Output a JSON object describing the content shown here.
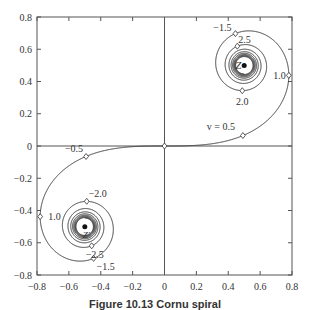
{
  "chart_data": {
    "type": "line",
    "title": "Cornu spiral",
    "xlabel": "",
    "ylabel": "",
    "xlim": [
      -0.8,
      0.8
    ],
    "ylim": [
      -0.8,
      0.8
    ],
    "grid": false,
    "x_ticks": [
      "-0.8",
      "-0.6",
      "-0.4",
      "-0.2",
      "0",
      "0.2",
      "0.4",
      "0.6",
      "0.8"
    ],
    "y_ticks": [
      "0.8",
      "0.6",
      "0.4",
      "0.2",
      "0",
      "-0.2",
      "-0.4",
      "-0.6",
      "-0.8"
    ],
    "series": [
      {
        "name": "Cornu spiral C(v), S(v)",
        "v_range": [
          -6,
          6
        ],
        "description": "x = C(v) = integral cos(pi t^2/2), y = S(v) = integral sin(pi t^2/2)"
      }
    ],
    "markers": [
      {
        "v": 0.0,
        "x": 0.0,
        "y": 0.0,
        "label": ""
      },
      {
        "v": 0.5,
        "x": 0.492,
        "y": 0.065,
        "label": "v = 0.5"
      },
      {
        "v": 1.0,
        "x": 0.78,
        "y": 0.438,
        "label": "1.0"
      },
      {
        "v": 1.5,
        "x": 0.445,
        "y": 0.697,
        "label": "-1.5"
      },
      {
        "v": 2.0,
        "x": 0.488,
        "y": 0.343,
        "label": "2.0"
      },
      {
        "v": 2.5,
        "x": 0.457,
        "y": 0.619,
        "label": "2.5"
      },
      {
        "v": -0.5,
        "x": -0.492,
        "y": -0.065,
        "label": "-0.5"
      },
      {
        "v": -1.0,
        "x": -0.78,
        "y": -0.438,
        "label": "1.0"
      },
      {
        "v": -1.5,
        "x": -0.445,
        "y": -0.697,
        "label": "-1.5"
      },
      {
        "v": -2.0,
        "x": -0.488,
        "y": -0.343,
        "label": "-2.0"
      },
      {
        "v": -2.5,
        "x": -0.457,
        "y": -0.619,
        "label": "-2.5"
      }
    ],
    "annotations": [
      {
        "text": "Z",
        "x": 0.5,
        "y": 0.5
      },
      {
        "text": "Z'",
        "x": -0.5,
        "y": -0.5
      }
    ]
  },
  "caption": "Figure 10.13   Cornu spiral"
}
